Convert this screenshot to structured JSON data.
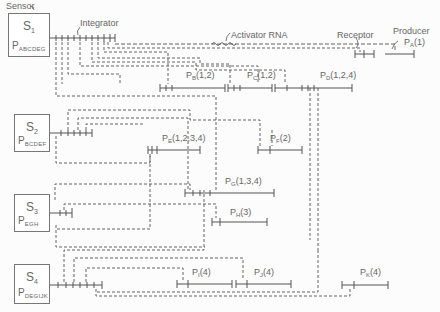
{
  "annotations": {
    "sensor": "Sensor",
    "integrator": "Integrator",
    "activator_rna": "Activator RNA",
    "receptor": "Receptor",
    "producer": "Producer"
  },
  "sensors": [
    {
      "id": "S1",
      "letter": "S",
      "index": "1",
      "p_letter": "P",
      "p_sub": "ABCDEG",
      "x": 8,
      "y": 13,
      "w": 42,
      "h": 44
    },
    {
      "id": "S2",
      "letter": "S",
      "index": "2",
      "p_letter": "P",
      "p_sub": "BCDEF",
      "x": 14,
      "y": 114,
      "w": 36,
      "h": 38
    },
    {
      "id": "S3",
      "letter": "S",
      "index": "3",
      "p_letter": "P",
      "p_sub": "EGH",
      "x": 14,
      "y": 194,
      "w": 36,
      "h": 38
    },
    {
      "id": "S4",
      "letter": "S",
      "index": "4",
      "p_letter": "P",
      "p_sub": "DEGIJK",
      "x": 14,
      "y": 264,
      "w": 36,
      "h": 40
    }
  ],
  "producers": [
    {
      "id": "PA",
      "letter": "P",
      "sub": "A",
      "genes": "(1)",
      "lx": 395,
      "ly": 37
    },
    {
      "id": "PB",
      "letter": "P",
      "sub": "B",
      "genes": "(1,2)",
      "lx": 186,
      "ly": 71
    },
    {
      "id": "PC",
      "letter": "P",
      "sub": "C",
      "genes": "(1,2)",
      "lx": 247,
      "ly": 71
    },
    {
      "id": "PD",
      "letter": "P",
      "sub": "D",
      "genes": "(1,2,4)",
      "lx": 320,
      "ly": 71
    },
    {
      "id": "PE",
      "letter": "P",
      "sub": "E",
      "genes": "(1,2,3,4)",
      "lx": 162,
      "ly": 132
    },
    {
      "id": "PF",
      "letter": "P",
      "sub": "F",
      "genes": "(2)",
      "lx": 270,
      "ly": 132
    },
    {
      "id": "PG",
      "letter": "P",
      "sub": "G",
      "genes": "(1,3,4)",
      "lx": 225,
      "ly": 177
    },
    {
      "id": "PH",
      "letter": "P",
      "sub": "H",
      "genes": "(3)",
      "lx": 230,
      "ly": 208
    },
    {
      "id": "PI",
      "letter": "P",
      "sub": "I",
      "genes": "(4)",
      "lx": 192,
      "ly": 268
    },
    {
      "id": "PJ",
      "letter": "P",
      "sub": "J",
      "genes": "(4)",
      "lx": 254,
      "ly": 268
    },
    {
      "id": "PK",
      "letter": "P",
      "sub": "K",
      "genes": "(4)",
      "lx": 360,
      "ly": 268
    }
  ],
  "colors": {
    "line": "#555555",
    "text": "#666666",
    "background": "#fcfcfc"
  }
}
